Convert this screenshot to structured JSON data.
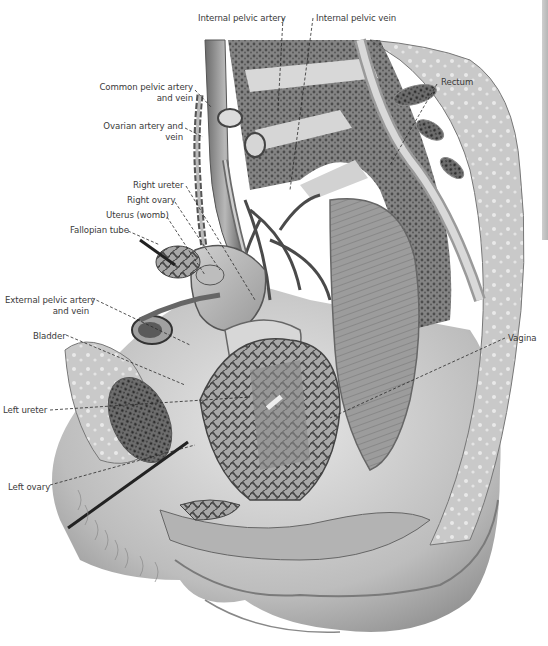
{
  "figure": {
    "style": "grayscale anatomical engraving",
    "leader_line_style": "dashed",
    "label_color": "#3a3a3a"
  },
  "labels": [
    {
      "id": "internal-pelvic-artery",
      "text": "Internal pelvic artery",
      "x": 198,
      "y": 13,
      "align": "left",
      "line": [
        [
          283,
          18
        ],
        [
          278,
          110
        ]
      ]
    },
    {
      "id": "internal-pelvic-vein",
      "text": "Internal pelvic vein",
      "x": 316,
      "y": 13,
      "align": "left",
      "line": [
        [
          313,
          18
        ],
        [
          290,
          190
        ]
      ]
    },
    {
      "id": "common-pelvic-artery-and-vein",
      "text": "Common pelvic artery",
      "text2": "and vein",
      "x": 97,
      "y": 82,
      "align": "right",
      "line": [
        [
          195,
          90
        ],
        [
          212,
          108
        ]
      ]
    },
    {
      "id": "ovarian-artery-and-vein",
      "text": "Ovarian artery and",
      "text2": "vein",
      "x": 108,
      "y": 121,
      "align": "right",
      "line": [
        [
          185,
          128
        ],
        [
          203,
          137
        ]
      ]
    },
    {
      "id": "rectum",
      "text": "Rectum",
      "x": 441,
      "y": 77,
      "align": "left",
      "line": [
        [
          437,
          84
        ],
        [
          390,
          165
        ]
      ]
    },
    {
      "id": "right-ureter",
      "text": "Right ureter",
      "x": 133,
      "y": 180,
      "align": "left",
      "line": [
        [
          186,
          186
        ],
        [
          255,
          300
        ]
      ]
    },
    {
      "id": "right-ovary",
      "text": "Right ovary",
      "x": 127,
      "y": 195,
      "align": "left",
      "line": [
        [
          175,
          202
        ],
        [
          220,
          270
        ]
      ]
    },
    {
      "id": "uterus-womb",
      "text": "Uterus (womb)",
      "x": 106,
      "y": 210,
      "align": "left",
      "line": [
        [
          167,
          217
        ],
        [
          205,
          275
        ]
      ]
    },
    {
      "id": "fallopian-tube",
      "text": "Fallopian tube",
      "x": 70,
      "y": 225,
      "align": "left",
      "line": [
        [
          128,
          231
        ],
        [
          160,
          245
        ]
      ]
    },
    {
      "id": "external-pelvic-artery-and-vein",
      "text": "External pelvic artery",
      "text2": "and vein",
      "x": 5,
      "y": 295,
      "align": "right",
      "line": [
        [
          92,
          298
        ],
        [
          190,
          345
        ]
      ]
    },
    {
      "id": "bladder",
      "text": "Bladder",
      "x": 33,
      "y": 331,
      "align": "left",
      "line": [
        [
          66,
          335
        ],
        [
          185,
          385
        ]
      ]
    },
    {
      "id": "vagina",
      "text": "Vagina",
      "x": 508,
      "y": 333,
      "align": "left",
      "line": [
        [
          505,
          338
        ],
        [
          330,
          418
        ]
      ]
    },
    {
      "id": "left-ureter",
      "text": "Left ureter",
      "x": 3,
      "y": 405,
      "align": "left",
      "line": [
        [
          50,
          410
        ],
        [
          250,
          397
        ]
      ]
    },
    {
      "id": "left-ovary",
      "text": "Left ovary",
      "x": 8,
      "y": 482,
      "align": "left",
      "line": [
        [
          50,
          485
        ],
        [
          195,
          445
        ]
      ]
    }
  ]
}
